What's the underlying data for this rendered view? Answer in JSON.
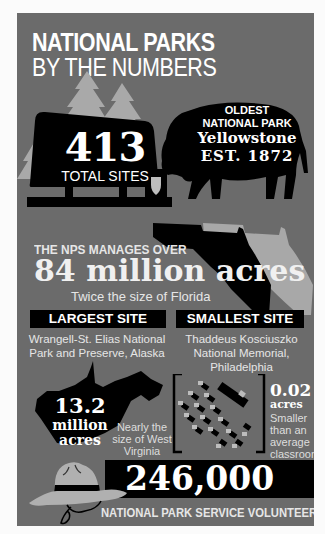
{
  "title": {
    "line1": "NATIONAL PARKS",
    "line2": "BY THE NUMBERS"
  },
  "total_sites": {
    "value": "413",
    "label": "TOTAL SITES",
    "icons": [
      "tree-icon",
      "sign-icon",
      "arrowhead-icon"
    ]
  },
  "oldest_park": {
    "line1": "OLDEST",
    "line2": "NATIONAL PARK",
    "name": "Yellowstone",
    "established": "EST. 1872",
    "icon": "bison-icon"
  },
  "acreage": {
    "intro": "THE NPS MANAGES OVER",
    "value": "84 million acres",
    "comparison": "Twice the size of Florida",
    "icon": "florida-map-icon"
  },
  "largest_site": {
    "header": "LARGEST SITE",
    "name": "Wrangell-St. Elias National Park and Preserve, Alaska",
    "value": "13.2",
    "unit_line1": "million",
    "unit_line2": "acres",
    "comparison": "Nearly the size of West Virginia",
    "icon": "west-virginia-map-icon"
  },
  "smallest_site": {
    "header": "SMALLEST SITE",
    "name": "Thaddeus Kosciuszko National Memorial, Philadelphia",
    "value": "0.02",
    "unit": "acres",
    "comparison": "Smaller than an average classroom",
    "icon": "classroom-desks-icon"
  },
  "volunteers": {
    "value": "246,000",
    "label": "NATIONAL PARK SERVICE VOLUNTEERS",
    "icon": "ranger-hat-icon"
  },
  "colors": {
    "background": "#6b6b6b",
    "black": "#000000",
    "light_gray": "#aaaaaa",
    "text": "#ffffff"
  }
}
